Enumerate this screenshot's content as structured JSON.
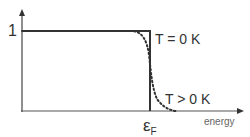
{
  "diagram": {
    "y_tick_label": "1",
    "curve_t0_label": "T = 0 K",
    "curve_tpos_label": "T > 0 K",
    "x_axis_label": "energy",
    "fermi_symbol": "ε",
    "fermi_subscript": "F",
    "colors": {
      "line": "#333333",
      "text": "#333333",
      "axis_label": "#666666"
    }
  }
}
